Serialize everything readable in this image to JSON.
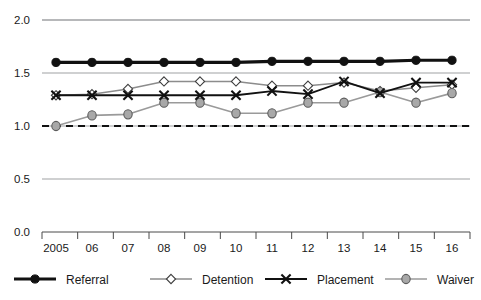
{
  "chart_data": {
    "type": "line",
    "title": "",
    "subtitle": "",
    "xlabel": "",
    "ylabel": "",
    "categories": [
      "2005",
      "06",
      "07",
      "08",
      "09",
      "10",
      "11",
      "12",
      "13",
      "14",
      "15",
      "16"
    ],
    "x_tick_labels": [
      "2005",
      "06",
      "07",
      "08",
      "09",
      "10",
      "11",
      "12",
      "13",
      "14",
      "15",
      "16"
    ],
    "y_tick_labels": [
      "0.0",
      "0.5",
      "1.0",
      "1.5",
      "2.0"
    ],
    "y_tick_values": [
      0.0,
      0.5,
      1.0,
      1.5,
      2.0
    ],
    "ylim": [
      0.0,
      2.0
    ],
    "grid": true,
    "grid_axis": "y",
    "legend_position": "bottom",
    "reference_line": {
      "value": 1.0,
      "style": "dashed",
      "color": "#111111"
    },
    "series": [
      {
        "name": "Referral",
        "marker": "filled-circle",
        "color": "#111111",
        "values": [
          1.6,
          1.6,
          1.6,
          1.6,
          1.6,
          1.6,
          1.61,
          1.61,
          1.61,
          1.61,
          1.62,
          1.62
        ]
      },
      {
        "name": "Detention",
        "marker": "open-diamond",
        "color": "#8c8c8c",
        "values": [
          1.29,
          1.3,
          1.35,
          1.42,
          1.42,
          1.42,
          1.38,
          1.38,
          1.41,
          1.33,
          1.36,
          1.39
        ]
      },
      {
        "name": "Placement",
        "marker": "x-cross",
        "color": "#111111",
        "values": [
          1.29,
          1.29,
          1.29,
          1.29,
          1.29,
          1.29,
          1.33,
          1.3,
          1.42,
          1.31,
          1.41,
          1.41
        ]
      },
      {
        "name": "Waiver",
        "marker": "gray-circle",
        "color": "#9a9a9a",
        "values": [
          1.0,
          1.1,
          1.11,
          1.22,
          1.22,
          1.12,
          1.12,
          1.22,
          1.22,
          1.32,
          1.22,
          1.31
        ]
      }
    ]
  },
  "legend": {
    "items": [
      {
        "label": "Referral",
        "marker": "filled-circle"
      },
      {
        "label": "Detention",
        "marker": "open-diamond"
      },
      {
        "label": "Placement",
        "marker": "x-cross"
      },
      {
        "label": "Waiver",
        "marker": "gray-circle"
      }
    ]
  },
  "colors": {
    "gridline": "#8f9194",
    "axis": "#4a4a4a",
    "referral": "#111111",
    "detention": "#8c8c8c",
    "placement": "#111111",
    "waiver": "#9a9a9a",
    "text": "#1a1a1a",
    "background": "#ffffff"
  }
}
